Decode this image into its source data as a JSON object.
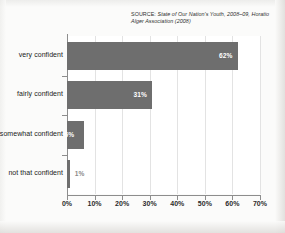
{
  "source": {
    "lead": "SOURCE:",
    "line1": "State of Our Nation's Youth, 2008–09,",
    "line2": "Horatio Alger Association (2008)"
  },
  "colors": {
    "bar_fill": "#6e6e6e",
    "plot_background": "#ffffff",
    "page_background": "#fbfbfa",
    "gridline": "#e3e3e3",
    "axis": "#8d8d8d",
    "inside_label": "#ffffff",
    "outside_label": "#8a8a8a"
  },
  "chart_data": {
    "type": "bar",
    "orientation": "horizontal",
    "title": "",
    "xlabel": "",
    "ylabel": "",
    "categories": [
      "very confident",
      "fairly confident",
      "somewhat confident",
      "not that confident"
    ],
    "values": [
      62,
      31,
      6,
      1
    ],
    "value_labels": [
      "62%",
      "31%",
      "6%",
      "1%"
    ],
    "label_placement": [
      "inside",
      "inside",
      "inside",
      "outside"
    ],
    "xlim": [
      0,
      70
    ],
    "xticks": [
      0,
      10,
      20,
      30,
      40,
      50,
      60,
      70
    ],
    "xtick_labels": [
      "0%",
      "10%",
      "20%",
      "30%",
      "40%",
      "50%",
      "60%",
      "70%"
    ],
    "grid": "vertical",
    "legend": "none"
  }
}
